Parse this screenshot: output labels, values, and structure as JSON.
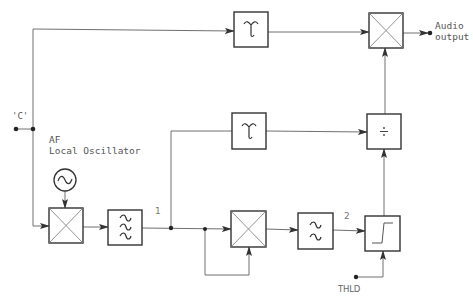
{
  "diagram": {
    "labels": {
      "input": "'C'",
      "oscillator": "AF\nLocal Oscillator",
      "node1": "1",
      "node2": "2",
      "threshold": "THLD",
      "output": "Audio\noutput"
    },
    "blocks": [
      {
        "id": "oscillator",
        "type": "sine-source"
      },
      {
        "id": "mixer-1",
        "type": "mixer"
      },
      {
        "id": "bandpass-filter",
        "type": "bandpass-filter"
      },
      {
        "id": "mixer-2",
        "type": "mixer"
      },
      {
        "id": "lowpass-filter",
        "type": "lowpass-filter"
      },
      {
        "id": "threshold-comparator",
        "type": "threshold"
      },
      {
        "id": "delay-top",
        "type": "delay"
      },
      {
        "id": "delay-middle",
        "type": "delay"
      },
      {
        "id": "divider",
        "type": "divide",
        "symbol": "÷"
      },
      {
        "id": "output-mixer",
        "type": "mixer"
      }
    ],
    "colors": {
      "line": "#707070",
      "box": "#3a3a3a",
      "text": "#555555"
    }
  }
}
